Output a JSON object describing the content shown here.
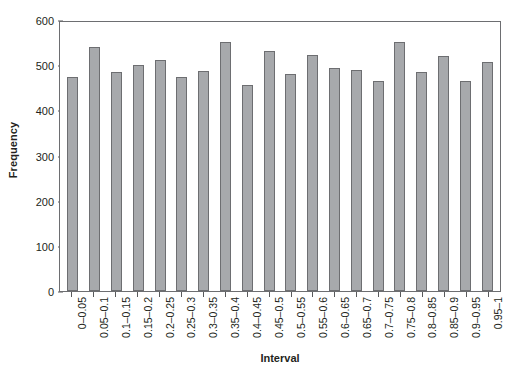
{
  "chart_data": {
    "type": "bar",
    "title": "",
    "xlabel": "Interval",
    "ylabel": "Frequency",
    "categories": [
      "0–0.05",
      "0.05–0.1",
      "0.1–0.15",
      "0.15–0.2",
      "0.2–0.25",
      "0.25–0.3",
      "0.3–0.35",
      "0.35–0.4",
      "0.4–0.45",
      "0.45–0.5",
      "0.5–0.55",
      "0.55–0.6",
      "0.6–0.65",
      "0.65–0.7",
      "0.7–0.75",
      "0.75–0.8",
      "0.8–0.85",
      "0.85–0.9",
      "0.9–0.95",
      "0.95–1"
    ],
    "values": [
      473,
      540,
      484,
      500,
      512,
      473,
      488,
      551,
      457,
      532,
      481,
      522,
      494,
      490,
      466,
      551,
      485,
      521,
      466,
      508
    ],
    "ylim": [
      0,
      600
    ],
    "yticks": [
      0,
      100,
      200,
      300,
      400,
      500,
      600
    ],
    "ytick_labels": [
      "0",
      "100",
      "200",
      "300",
      "400",
      "500",
      "600"
    ],
    "grid": false,
    "legend": null,
    "bar_color": "#a7a9ac",
    "bar_edge_color": "#6d6e71",
    "axis_color": "#6d6e71",
    "background": "#ffffff"
  }
}
